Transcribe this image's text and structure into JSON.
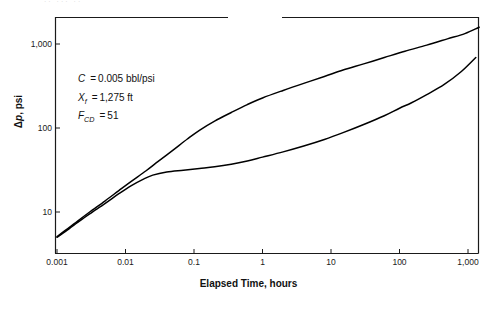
{
  "figure": {
    "top_crop_artifact": "··   ···    ··"
  },
  "annotation": {
    "lines": [
      {
        "symbol": "C",
        "subscript": "",
        "equals": "=",
        "value": "0.005 bbl/psi"
      },
      {
        "symbol": "X",
        "subscript": "f",
        "equals": "=",
        "value": "1,275 ft"
      },
      {
        "symbol": "F",
        "subscript": "CD",
        "equals": "=",
        "value": "51"
      }
    ]
  },
  "chart_data": {
    "type": "line",
    "title": "",
    "xlabel": "Elapsed Time, hours",
    "ylabel_prefix": "Δ",
    "ylabel_italic": "p",
    "ylabel_suffix": ", psi",
    "xscale": "log",
    "yscale": "log",
    "xlim": [
      0.001,
      2000
    ],
    "ylim": [
      5,
      2000
    ],
    "grid": false,
    "legend": "none",
    "xticks": [
      0.001,
      0.01,
      0.1,
      1,
      10,
      100,
      1000
    ],
    "xtick_labels": [
      "0.001",
      "0.01",
      "0.1",
      "1",
      "10",
      "100",
      "1,000"
    ],
    "yticks": [
      10,
      100,
      1000
    ],
    "ytick_labels": [
      "10",
      "100",
      "1,000"
    ],
    "series": [
      {
        "name": "upper-curve",
        "color": "#000000",
        "x": [
          0.001,
          0.0015,
          0.002,
          0.003,
          0.005,
          0.008,
          0.012,
          0.02,
          0.03,
          0.05,
          0.08,
          0.12,
          0.2,
          0.35,
          0.6,
          1,
          2,
          4,
          8,
          15,
          30,
          60,
          120,
          250,
          500,
          900,
          1400,
          2000
        ],
        "y": [
          5.1,
          6.5,
          7.8,
          10.0,
          13.5,
          18.0,
          23.0,
          31.0,
          40.0,
          55.0,
          74.0,
          94.0,
          121,
          153,
          190,
          228,
          280,
          340,
          410,
          490,
          580,
          690,
          820,
          970,
          1150,
          1330,
          1560,
          1800
        ]
      },
      {
        "name": "lower-curve",
        "color": "#000000",
        "x": [
          0.001,
          0.0015,
          0.002,
          0.003,
          0.005,
          0.008,
          0.012,
          0.018,
          0.025,
          0.04,
          0.07,
          0.12,
          0.2,
          0.35,
          0.6,
          1,
          2,
          4,
          8,
          15,
          30,
          60,
          100,
          150,
          250,
          450,
          800,
          1300
        ],
        "y": [
          5.0,
          6.3,
          7.5,
          9.5,
          12.6,
          16.5,
          20.5,
          24.5,
          27.5,
          30.0,
          31.5,
          33.0,
          34.5,
          37.0,
          40.5,
          45.0,
          52.0,
          61.0,
          73.0,
          88.0,
          110,
          140,
          172,
          200,
          250,
          330,
          470,
          690
        ]
      }
    ]
  }
}
